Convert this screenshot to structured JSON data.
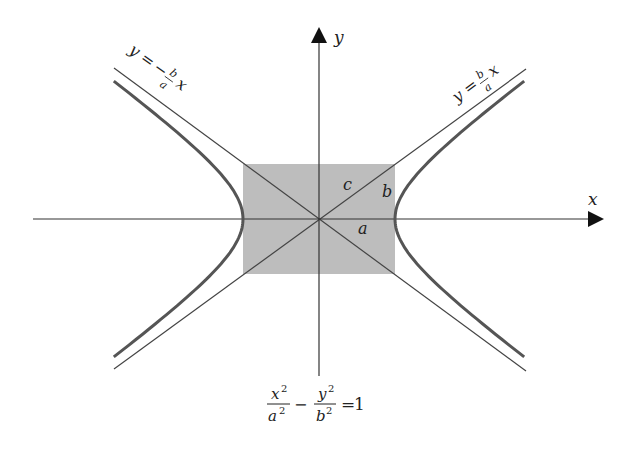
{
  "diagram": {
    "axes": {
      "x_label": "x",
      "y_label": "y"
    },
    "rectangle_labels": {
      "a": "a",
      "b": "b",
      "c": "c"
    },
    "asymptotes": {
      "positive": {
        "lhs": "y",
        "eq": "=",
        "num": "b",
        "den": "a",
        "var": "x",
        "sign": ""
      },
      "negative": {
        "lhs": "y",
        "eq": "=",
        "num": "b",
        "den": "a",
        "var": "x",
        "sign": "−"
      }
    },
    "equation": {
      "term1_num": "x",
      "term1_den": "a",
      "term2_num": "y",
      "term2_den": "b",
      "exp": "2",
      "minus": "−",
      "eq": "=",
      "rhs": "1"
    },
    "colors": {
      "rectangle": "#bdbdbd",
      "hyperbola": "#555555",
      "axis": "#333333",
      "asymptote": "#444444"
    }
  }
}
